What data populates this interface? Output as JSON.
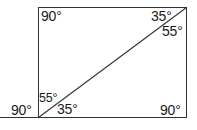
{
  "figure": {
    "kind": "geometry-diagram",
    "stroke_color": "#333333",
    "background_color": "#ffffff",
    "text_color": "#1a1a1a",
    "rectangle": {
      "left": 38,
      "top": 7,
      "right": 187,
      "bottom": 118
    },
    "diagonal": {
      "from": "bottom-left-corner",
      "to": "top-right-corner",
      "x1": 38,
      "y1": 118,
      "x2": 187,
      "y2": 7
    },
    "baseline_extension": {
      "x1": 0,
      "y1": 118,
      "x2": 38,
      "y2": 118
    }
  },
  "labels": {
    "top_left": "90°",
    "top_right_upper": "35°",
    "top_right_lower": "55°",
    "bottom_left_outer": "90°",
    "bottom_left_upper": "55°",
    "bottom_left_lower": "35°",
    "bottom_right": "90°"
  }
}
